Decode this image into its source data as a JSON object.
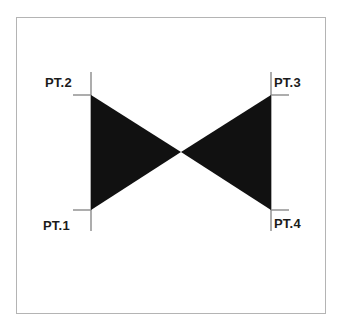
{
  "figure": {
    "title": "",
    "background_color": "#ffffff",
    "frame": {
      "border_color": "#b4b4b4",
      "x": 16,
      "y": 17,
      "width": 310,
      "height": 297
    },
    "fill_color": "#111111",
    "line_color": "#8a8a8a",
    "labels": {
      "pt1": "PT.1",
      "pt2": "PT.2",
      "pt3": "PT.3",
      "pt4": "PT.4"
    },
    "geometry": {
      "description": "Two solid black triangles forming a bowtie / hourglass shape meeting at a central vertex",
      "left_edge_x": 91,
      "right_edge_x": 271,
      "top_y": 95,
      "bottom_y": 210,
      "center_x": 181,
      "center_y": 152,
      "extension_line_top_y": 72,
      "extension_line_bottom_y": 231,
      "tick_length": 18
    },
    "points": [
      {
        "name": "PT.1",
        "x": 91,
        "y": 210,
        "corner": "bottom-left"
      },
      {
        "name": "PT.2",
        "x": 91,
        "y": 95,
        "corner": "top-left"
      },
      {
        "name": "PT.3",
        "x": 271,
        "y": 95,
        "corner": "top-right"
      },
      {
        "name": "PT.4",
        "x": 271,
        "y": 210,
        "corner": "bottom-right"
      }
    ]
  }
}
